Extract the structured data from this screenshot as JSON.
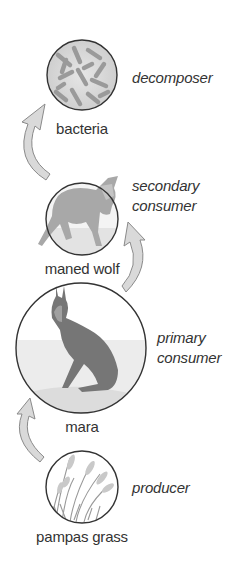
{
  "organisms": [
    {
      "name": "bacteria",
      "role": "decomposer",
      "role_lines": [
        "decomposer"
      ]
    },
    {
      "name": "maned wolf",
      "role": "secondary consumer",
      "role_lines": [
        "secondary",
        "consumer"
      ]
    },
    {
      "name": "mara",
      "role": "primary consumer",
      "role_lines": [
        "primary",
        "consumer"
      ]
    },
    {
      "name": "pampas grass",
      "role": "producer",
      "role_lines": [
        "producer"
      ]
    }
  ],
  "arrows": [
    {
      "from": "pampas grass",
      "to": "mara"
    },
    {
      "from": "mara",
      "to": "maned wolf"
    },
    {
      "from": "maned wolf",
      "to": "bacteria"
    }
  ],
  "colors": {
    "circle_stroke": "#333333",
    "arrow_fill": "#d9d9d9",
    "arrow_stroke": "#8a8a8a",
    "text": "#333333"
  }
}
